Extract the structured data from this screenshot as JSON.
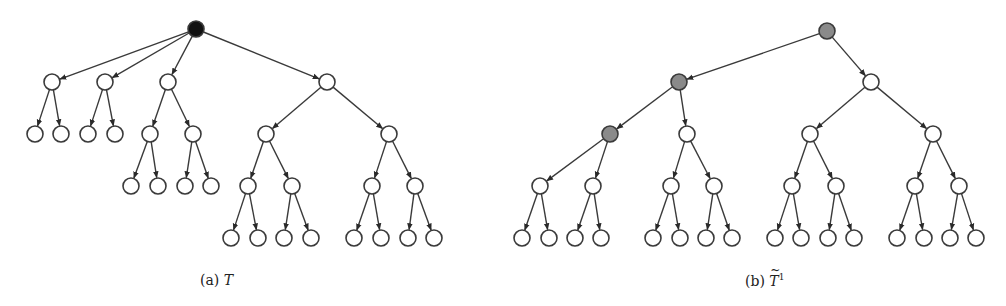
{
  "figure": {
    "node_radius": 8,
    "colors": {
      "root_a_fill": "#111111",
      "highlight_fill": "#8a8a8a",
      "normal_fill": "#ffffff",
      "stroke": "#3a3a3a"
    },
    "subfigures": [
      {
        "id": "a",
        "caption_label": "(a)",
        "caption_symbol": "T",
        "caption_sup": "",
        "caption_x": 200,
        "nodes": [
          {
            "id": "r",
            "x": 196,
            "y": 29,
            "fill": "root_a_fill"
          },
          {
            "id": "n1",
            "x": 52,
            "y": 82
          },
          {
            "id": "n2",
            "x": 105,
            "y": 82
          },
          {
            "id": "n3",
            "x": 168,
            "y": 82
          },
          {
            "id": "n4",
            "x": 327,
            "y": 82
          },
          {
            "id": "l11",
            "x": 35,
            "y": 134
          },
          {
            "id": "l12",
            "x": 61,
            "y": 134
          },
          {
            "id": "l21",
            "x": 88,
            "y": 134
          },
          {
            "id": "l22",
            "x": 115,
            "y": 134
          },
          {
            "id": "n31",
            "x": 150,
            "y": 134
          },
          {
            "id": "n32",
            "x": 193,
            "y": 134
          },
          {
            "id": "l311",
            "x": 131,
            "y": 186
          },
          {
            "id": "l312",
            "x": 158,
            "y": 186
          },
          {
            "id": "l321",
            "x": 185,
            "y": 186
          },
          {
            "id": "l322",
            "x": 211,
            "y": 186
          },
          {
            "id": "n41",
            "x": 266,
            "y": 134
          },
          {
            "id": "n42",
            "x": 389,
            "y": 134
          },
          {
            "id": "n411",
            "x": 248,
            "y": 186
          },
          {
            "id": "n412",
            "x": 292,
            "y": 186
          },
          {
            "id": "n421",
            "x": 372,
            "y": 186
          },
          {
            "id": "n422",
            "x": 415,
            "y": 186
          },
          {
            "id": "l4111",
            "x": 231,
            "y": 238
          },
          {
            "id": "l4112",
            "x": 258,
            "y": 238
          },
          {
            "id": "l4121",
            "x": 284,
            "y": 238
          },
          {
            "id": "l4122",
            "x": 311,
            "y": 238
          },
          {
            "id": "l4211",
            "x": 354,
            "y": 238
          },
          {
            "id": "l4212",
            "x": 381,
            "y": 238
          },
          {
            "id": "l4221",
            "x": 408,
            "y": 238
          },
          {
            "id": "l4222",
            "x": 434,
            "y": 238
          }
        ],
        "edges": [
          [
            "r",
            "n1"
          ],
          [
            "r",
            "n2"
          ],
          [
            "r",
            "n3"
          ],
          [
            "r",
            "n4"
          ],
          [
            "n1",
            "l11"
          ],
          [
            "n1",
            "l12"
          ],
          [
            "n2",
            "l21"
          ],
          [
            "n2",
            "l22"
          ],
          [
            "n3",
            "n31"
          ],
          [
            "n3",
            "n32"
          ],
          [
            "n31",
            "l311"
          ],
          [
            "n31",
            "l312"
          ],
          [
            "n32",
            "l321"
          ],
          [
            "n32",
            "l322"
          ],
          [
            "n4",
            "n41"
          ],
          [
            "n4",
            "n42"
          ],
          [
            "n41",
            "n411"
          ],
          [
            "n41",
            "n412"
          ],
          [
            "n42",
            "n421"
          ],
          [
            "n42",
            "n422"
          ],
          [
            "n411",
            "l4111"
          ],
          [
            "n411",
            "l4112"
          ],
          [
            "n412",
            "l4121"
          ],
          [
            "n412",
            "l4122"
          ],
          [
            "n421",
            "l4211"
          ],
          [
            "n421",
            "l4212"
          ],
          [
            "n422",
            "l4221"
          ],
          [
            "n422",
            "l4222"
          ]
        ]
      },
      {
        "id": "b",
        "caption_label": "(b)",
        "caption_symbol": "T",
        "caption_sup": "1",
        "caption_x": 745,
        "nodes": [
          {
            "id": "r",
            "x": 827,
            "y": 31,
            "fill": "highlight_fill"
          },
          {
            "id": "a",
            "x": 679,
            "y": 82,
            "fill": "highlight_fill"
          },
          {
            "id": "b",
            "x": 871,
            "y": 82
          },
          {
            "id": "a1",
            "x": 610,
            "y": 134,
            "fill": "highlight_fill"
          },
          {
            "id": "a2",
            "x": 687,
            "y": 134
          },
          {
            "id": "b1",
            "x": 810,
            "y": 134
          },
          {
            "id": "b2",
            "x": 933,
            "y": 134
          },
          {
            "id": "a11",
            "x": 540,
            "y": 186
          },
          {
            "id": "a12",
            "x": 593,
            "y": 186
          },
          {
            "id": "a21",
            "x": 671,
            "y": 186
          },
          {
            "id": "a22",
            "x": 714,
            "y": 186
          },
          {
            "id": "b11",
            "x": 792,
            "y": 186
          },
          {
            "id": "b12",
            "x": 836,
            "y": 186
          },
          {
            "id": "b21",
            "x": 915,
            "y": 186
          },
          {
            "id": "b22",
            "x": 959,
            "y": 186
          },
          {
            "id": "a111",
            "x": 522,
            "y": 238
          },
          {
            "id": "a112",
            "x": 549,
            "y": 238
          },
          {
            "id": "a121",
            "x": 575,
            "y": 238
          },
          {
            "id": "a122",
            "x": 601,
            "y": 238
          },
          {
            "id": "a211",
            "x": 653,
            "y": 238
          },
          {
            "id": "a212",
            "x": 680,
            "y": 238
          },
          {
            "id": "a221",
            "x": 706,
            "y": 238
          },
          {
            "id": "a222",
            "x": 732,
            "y": 238
          },
          {
            "id": "b111",
            "x": 775,
            "y": 238
          },
          {
            "id": "b112",
            "x": 801,
            "y": 238
          },
          {
            "id": "b121",
            "x": 828,
            "y": 238
          },
          {
            "id": "b122",
            "x": 854,
            "y": 238
          },
          {
            "id": "b211",
            "x": 897,
            "y": 238
          },
          {
            "id": "b212",
            "x": 924,
            "y": 238
          },
          {
            "id": "b221",
            "x": 950,
            "y": 238
          },
          {
            "id": "b222",
            "x": 976,
            "y": 238
          }
        ],
        "edges": [
          [
            "r",
            "a"
          ],
          [
            "r",
            "b"
          ],
          [
            "a",
            "a1"
          ],
          [
            "a",
            "a2"
          ],
          [
            "b",
            "b1"
          ],
          [
            "b",
            "b2"
          ],
          [
            "a1",
            "a11"
          ],
          [
            "a1",
            "a12"
          ],
          [
            "a2",
            "a21"
          ],
          [
            "a2",
            "a22"
          ],
          [
            "b1",
            "b11"
          ],
          [
            "b1",
            "b12"
          ],
          [
            "b2",
            "b21"
          ],
          [
            "b2",
            "b22"
          ],
          [
            "a11",
            "a111"
          ],
          [
            "a11",
            "a112"
          ],
          [
            "a12",
            "a121"
          ],
          [
            "a12",
            "a122"
          ],
          [
            "a21",
            "a211"
          ],
          [
            "a21",
            "a212"
          ],
          [
            "a22",
            "a221"
          ],
          [
            "a22",
            "a222"
          ],
          [
            "b11",
            "b111"
          ],
          [
            "b11",
            "b112"
          ],
          [
            "b12",
            "b121"
          ],
          [
            "b12",
            "b122"
          ],
          [
            "b21",
            "b211"
          ],
          [
            "b21",
            "b212"
          ],
          [
            "b22",
            "b221"
          ],
          [
            "b22",
            "b222"
          ]
        ]
      }
    ]
  }
}
